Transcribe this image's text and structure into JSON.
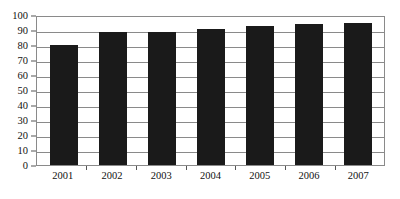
{
  "chart_data": {
    "type": "bar",
    "title": "",
    "subtitle": "",
    "xlabel": "",
    "ylabel": "",
    "categories": [
      "2001",
      "2002",
      "2003",
      "2004",
      "2005",
      "2006",
      "2007"
    ],
    "values": [
      80,
      89,
      89,
      91,
      93,
      94,
      95
    ],
    "series": [
      {
        "name": "",
        "values": [
          80,
          89,
          89,
          91,
          93,
          94,
          95
        ],
        "color": "#1a1a1a"
      }
    ],
    "ylim": [
      0,
      100
    ],
    "yticks": [
      0,
      10,
      20,
      30,
      40,
      50,
      60,
      70,
      80,
      90,
      100
    ],
    "ytick_labels": [
      "0",
      "10",
      "20",
      "30",
      "40",
      "50",
      "60",
      "70",
      "80",
      "90",
      "100"
    ],
    "xtick_labels": [
      "2001",
      "2002",
      "2003",
      "2004",
      "2005",
      "2006",
      "2007"
    ],
    "grid": "horizontal",
    "legend": "none",
    "annotations": [],
    "colors": {
      "bar": "#1a1a1a",
      "grid": "#8a8a8a",
      "border": "#8a8a8a",
      "text": "#111111",
      "background": "#ffffff"
    }
  }
}
